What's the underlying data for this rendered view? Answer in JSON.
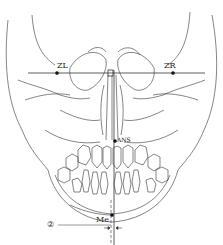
{
  "diagram": {
    "type": "frontal cephalometric tracing",
    "labels": {
      "zl": "ZL",
      "zr": "ZR",
      "ans": "ANS",
      "me": "Me",
      "marker": "②"
    },
    "colors": {
      "line": "#333333",
      "background": "#ffffff"
    },
    "points": {
      "ZL": [
        57,
        73
      ],
      "ZR": [
        173,
        73
      ],
      "midpoint": [
        111,
        73
      ],
      "ANS": [
        115,
        141
      ],
      "Me": [
        112,
        215
      ]
    }
  }
}
